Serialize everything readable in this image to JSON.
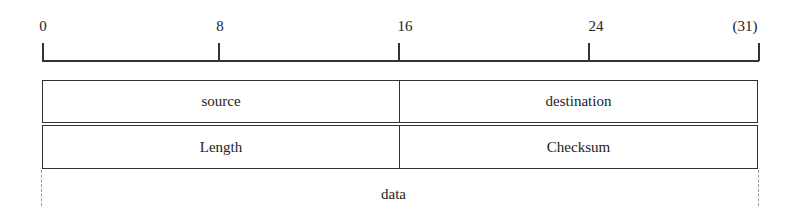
{
  "ruler": {
    "ticks": [
      {
        "label": "0",
        "x": 42
      },
      {
        "label": "8",
        "x": 219
      },
      {
        "label": "16",
        "x": 398
      },
      {
        "label": "24",
        "x": 588
      },
      {
        "label": "(31)",
        "x": 758
      }
    ]
  },
  "rows": [
    {
      "left": "source",
      "right": "destination"
    },
    {
      "left": "Length",
      "right": "Checksum"
    }
  ],
  "data_region": {
    "label": "data"
  }
}
